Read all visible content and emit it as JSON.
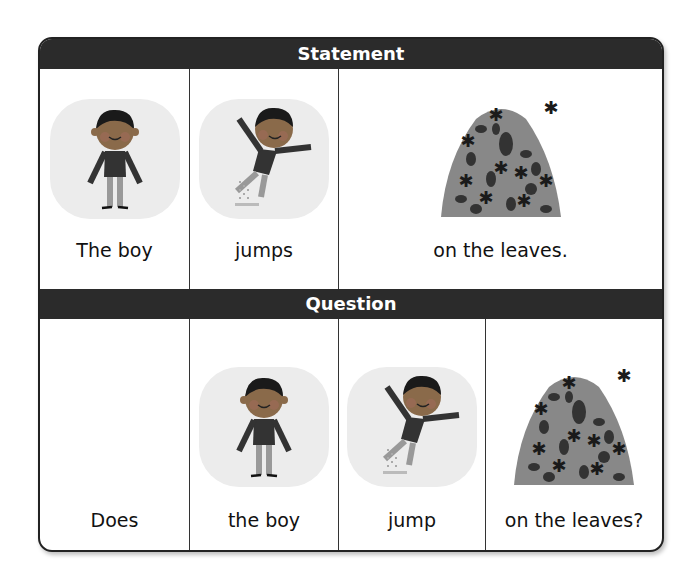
{
  "statement": {
    "header": "Statement",
    "cells": [
      {
        "label": "The boy",
        "image": "boy-standing"
      },
      {
        "label": "jumps",
        "image": "boy-jumping"
      },
      {
        "label": "on the leaves.",
        "image": "leaf-pile"
      }
    ]
  },
  "question": {
    "header": "Question",
    "cells": [
      {
        "label": "Does",
        "image": ""
      },
      {
        "label": "the boy",
        "image": "boy-standing"
      },
      {
        "label": "jump",
        "image": "boy-jumping"
      },
      {
        "label": "on the leaves?",
        "image": "leaf-pile"
      }
    ]
  },
  "colors": {
    "header_bg": "#2b2b2b",
    "header_text": "#ffffff",
    "border": "#222222",
    "bubble": "#ececec",
    "skin": "#8a6a4a",
    "shirt": "#3a3a3a"
  }
}
